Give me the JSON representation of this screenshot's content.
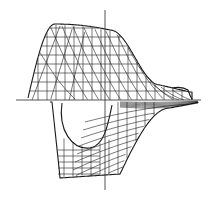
{
  "figure": {
    "type": "wireframe-surface-diagram",
    "parts": [
      {
        "name": "upper-mesh",
        "grid": "curved longitudinal lines crossed by vertical stations"
      },
      {
        "name": "lower-mesh",
        "grid": "curved lines with hollow opening on left"
      }
    ],
    "axes": {
      "horizontal": true,
      "vertical": true
    },
    "line_color": "#1a1a1a",
    "background": "#ffffff",
    "text_labels": []
  }
}
